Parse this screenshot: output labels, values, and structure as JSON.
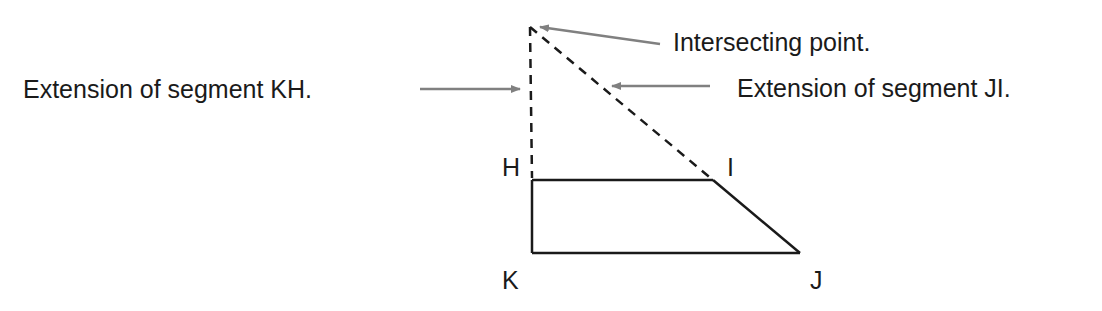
{
  "diagram": {
    "vertices": {
      "H": {
        "label": "H",
        "x": 532,
        "y": 180
      },
      "I": {
        "label": "I",
        "x": 713,
        "y": 180
      },
      "J": {
        "label": "J",
        "x": 800,
        "y": 253
      },
      "K": {
        "label": "K",
        "x": 532,
        "y": 253
      }
    },
    "intersection_point": {
      "x": 530,
      "y": 27
    },
    "annotations": {
      "intersecting_point": "Intersecting point.",
      "extension_kh": "Extension of segment KH.",
      "extension_ji": "Extension of segment JI."
    },
    "colors": {
      "line": "#1a1a1a",
      "arrow": "#808080",
      "text": "#1a1a1a"
    }
  }
}
